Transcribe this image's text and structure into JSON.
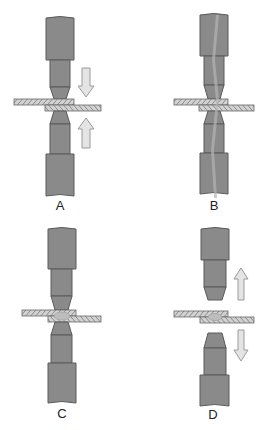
{
  "diagram": {
    "colors": {
      "electrode": "#8a8a8a",
      "electrode_edge": "#5a5a5a",
      "plate": "#c8c8c8",
      "plate_hatch": "#7a7a7a",
      "arrow_fill": "#e4e4e4",
      "arrow_edge": "#9a9a9a",
      "current_streak": "#a8a8a8",
      "nugget": "#bdbdbd",
      "background": "#ffffff"
    },
    "panels": [
      {
        "id": "A",
        "label": "A",
        "stage": "electrodes clamp sheets",
        "arrows": [
          "down",
          "up"
        ],
        "current": false,
        "nugget": false,
        "separated": false
      },
      {
        "id": "B",
        "label": "B",
        "stage": "current flows",
        "arrows": [],
        "current": true,
        "nugget": false,
        "separated": false
      },
      {
        "id": "C",
        "label": "C",
        "stage": "weld nugget forms",
        "arrows": [],
        "current": false,
        "nugget": true,
        "separated": false
      },
      {
        "id": "D",
        "label": "D",
        "stage": "electrodes retract",
        "arrows": [
          "up",
          "down"
        ],
        "current": false,
        "nugget": true,
        "separated": true
      }
    ]
  }
}
